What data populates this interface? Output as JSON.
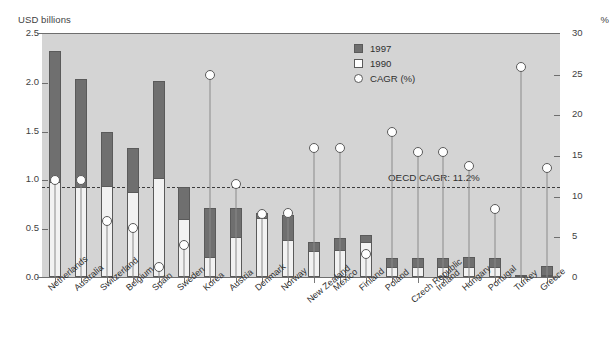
{
  "axis_left_unit": "USD billions",
  "axis_right_unit": "%",
  "legend": [
    {
      "key": "1997",
      "label": "1997",
      "swatch": "dark-square"
    },
    {
      "key": "1990",
      "label": "1990",
      "swatch": "white-square"
    },
    {
      "key": "cagr",
      "label": "CAGR (%)",
      "swatch": "white-circle"
    }
  ],
  "annotation": {
    "label": "OECD CAGR: 11.2%",
    "value": 11.2
  },
  "chart_data": {
    "type": "bar",
    "title": "",
    "subtitle": "",
    "xlabel": "",
    "ylabel": "USD billions",
    "y2label": "%",
    "ylim": [
      0.0,
      2.5
    ],
    "y2lim": [
      0,
      30
    ],
    "yticks": [
      "0.0",
      "0.5",
      "1.0",
      "1.5",
      "2.0",
      "2.5"
    ],
    "y2ticks": [
      "0",
      "5",
      "10",
      "15",
      "20",
      "25",
      "30"
    ],
    "grid": false,
    "legend_position": "top-right",
    "annotations": [
      {
        "text": "OECD CAGR: 11.2%",
        "axis": "y2",
        "value": 11.2,
        "style": "dashed-line"
      }
    ],
    "categories": [
      "Netherlands",
      "Australia",
      "Switzerland",
      "Belgium",
      "Spain",
      "Sweden",
      "Korea",
      "Austria",
      "Denmark",
      "Norway",
      "New Zealand",
      "Mexico",
      "Finland",
      "Poland",
      "Czech Republic",
      "Ireland",
      "Hungary",
      "Portugal",
      "Turkey",
      "Greece"
    ],
    "series": [
      {
        "name": "1997",
        "unit": "USD billions",
        "values": [
          2.32,
          2.03,
          1.49,
          1.32,
          2.01,
          0.92,
          0.71,
          0.71,
          0.66,
          0.64,
          0.36,
          0.4,
          0.43,
          0.19,
          0.19,
          0.19,
          0.2,
          0.19,
          0.02,
          0.11
        ]
      },
      {
        "name": "1990",
        "unit": "USD billions",
        "values": [
          0.97,
          0.92,
          0.93,
          0.87,
          1.01,
          0.59,
          0.2,
          0.41,
          0.6,
          0.38,
          0.27,
          0.28,
          0.36,
          0.1,
          0.1,
          0.1,
          0.1,
          0.1,
          0.01,
          0.02
        ]
      },
      {
        "name": "CAGR (%)",
        "unit": "%",
        "axis": "right",
        "values": [
          12.0,
          12.1,
          7.0,
          6.2,
          1.4,
          4.0,
          25.0,
          11.5,
          7.9,
          8.0,
          16.0,
          16.0,
          3.0,
          18.0,
          15.5,
          15.5,
          13.8,
          8.5,
          26.0,
          13.5
        ]
      }
    ]
  }
}
